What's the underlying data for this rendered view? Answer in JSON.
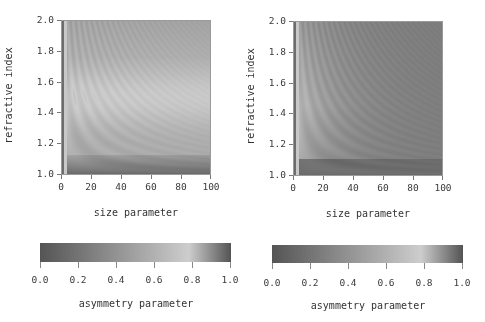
{
  "chart_data": [
    {
      "type": "heatmap",
      "title": "",
      "xlabel": "size parameter",
      "ylabel": "refractive index",
      "xlim": [
        0,
        100
      ],
      "ylim": [
        1.0,
        2.0
      ],
      "xticks": [
        "0",
        "20",
        "40",
        "60",
        "80",
        "100"
      ],
      "yticks": [
        "1.0",
        "1.2",
        "1.4",
        "1.6",
        "1.8",
        "2.0"
      ],
      "colorbar": {
        "label": "asymmetry parameter",
        "range": [
          0.0,
          1.0
        ],
        "ticks": [
          "0.0",
          "0.2",
          "0.4",
          "0.6",
          "0.8",
          "1.0"
        ],
        "colormap": "cyclic gray: dark at 0.0, mid-gray 0.4-0.6, light at ~0.78, dark at 1.0"
      },
      "description": "Asymmetry parameter vs size parameter and refractive index; bright ridge (g≈0.75-0.8) around n≈1.4-1.6 at large size, dark band near n≈1.0-1.1, resonance ripples near small size parameter",
      "grid": false
    },
    {
      "type": "heatmap",
      "title": "",
      "xlabel": "size parameter",
      "ylabel": "refractive index",
      "xlim": [
        0,
        100
      ],
      "ylim": [
        1.0,
        2.0
      ],
      "xticks": [
        "0",
        "20",
        "40",
        "60",
        "80",
        "100"
      ],
      "yticks": [
        "1.0",
        "1.2",
        "1.4",
        "1.6",
        "1.8",
        "2.0"
      ],
      "colorbar": {
        "label": "asymmetry parameter",
        "range": [
          0.0,
          1.0
        ],
        "ticks": [
          "0.0",
          "0.2",
          "0.4",
          "0.6",
          "0.8",
          "1.0"
        ],
        "colormap": "cyclic gray: dark at 0.0, mid-gray 0.4-0.6, light at ~0.78, dark at 1.0"
      },
      "description": "Asymmetry parameter vs size parameter and refractive index (second case); brighter ridges concentrated at small size parameters, field darkens toward large size parameter",
      "grid": false
    }
  ],
  "panels": {
    "left": {
      "xlabel": "size parameter",
      "ylabel": "refractive index",
      "xticks": [
        "0",
        "20",
        "40",
        "60",
        "80",
        "100"
      ],
      "yticks": [
        "2.0",
        "1.8",
        "1.6",
        "1.4",
        "1.2",
        "1.0"
      ],
      "colorbar_ticks": [
        "0.0",
        "0.2",
        "0.4",
        "0.6",
        "0.8",
        "1.0"
      ],
      "colorbar_label": "asymmetry parameter"
    },
    "right": {
      "xlabel": "size parameter",
      "ylabel": "refractive index",
      "xticks": [
        "0",
        "20",
        "40",
        "60",
        "80",
        "100"
      ],
      "yticks": [
        "2.0",
        "1.8",
        "1.6",
        "1.4",
        "1.2",
        "1.0"
      ],
      "colorbar_ticks": [
        "0.0",
        "0.2",
        "0.4",
        "0.6",
        "0.8",
        "1.0"
      ],
      "colorbar_label": "asymmetry parameter"
    }
  },
  "colors": {
    "frame": "#9a9a9a",
    "text": "#333333",
    "background": "#ffffff"
  }
}
